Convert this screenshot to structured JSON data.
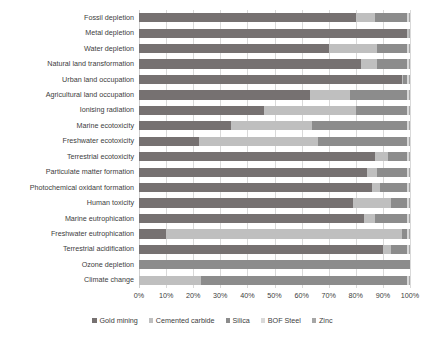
{
  "chart_data": {
    "type": "bar",
    "orientation": "horizontal",
    "stacked": true,
    "stack_mode": "percent",
    "title": "",
    "xlabel": "",
    "ylabel": "",
    "xlim": [
      0,
      100
    ],
    "xtick_labels": [
      "0%",
      "10%",
      "20%",
      "30%",
      "40%",
      "50%",
      "60%",
      "70%",
      "80%",
      "90%",
      "100%"
    ],
    "xtick_values": [
      0,
      10,
      20,
      30,
      40,
      50,
      60,
      70,
      80,
      90,
      100
    ],
    "grid": true,
    "grid_axis": "x",
    "legend_position": "bottom",
    "categories": [
      "Fossil depletion",
      "Metal depletion",
      "Water depletion",
      "Natural land transformation",
      "Urban land occupation",
      "Agricultural land occupation",
      "Ionising radiation",
      "Marine ecotoxicity",
      "Freshwater ecotoxicity",
      "Terrestrial ecotoxicity",
      "Particulate matter formation",
      "Photochemical oxidant formation",
      "Human toxicity",
      "Marine eutrophication",
      "Freshwater eutrophication",
      "Terrestrial acidification",
      "Ozone depletion",
      "Climate change"
    ],
    "series": [
      {
        "name": "Gold mining",
        "color": "#767171",
        "values": [
          80,
          99,
          70,
          82,
          97,
          63,
          46,
          34,
          22,
          87,
          84,
          86,
          79,
          83,
          10,
          90,
          0,
          0
        ]
      },
      {
        "name": "Cemented carbide",
        "color": "#BFBFBF",
        "values": [
          7,
          0.5,
          18,
          6,
          0.5,
          15,
          34,
          30,
          44,
          5,
          4,
          3,
          14,
          4,
          87,
          3,
          0,
          23
        ]
      },
      {
        "name": "Silica",
        "color": "#8C8C8C",
        "values": [
          12,
          0,
          11,
          11,
          1.5,
          21,
          19,
          35,
          33,
          7,
          11,
          10,
          6,
          12,
          2,
          6,
          100,
          76
        ]
      },
      {
        "name": "BOF Steel",
        "color": "#D9D9D9",
        "values": [
          0.5,
          0.25,
          0.5,
          0.5,
          0.5,
          0.5,
          0.5,
          0.5,
          0.5,
          0.5,
          0.5,
          0.5,
          0.5,
          0.5,
          0.5,
          0.5,
          0,
          0.5
        ]
      },
      {
        "name": "Zinc",
        "color": "#A6A6A6",
        "values": [
          0.5,
          0.25,
          0.5,
          0.5,
          0.5,
          0.5,
          0.5,
          0.5,
          0.5,
          0.5,
          0.5,
          0.5,
          0.5,
          0.5,
          0.5,
          0.5,
          0,
          0.5
        ]
      }
    ]
  }
}
